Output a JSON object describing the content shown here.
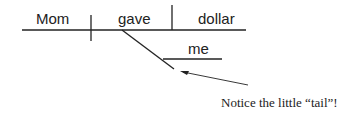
{
  "diagram": {
    "subject": "Mom",
    "verb": "gave",
    "direct_object": "dollar",
    "indirect_object": "me",
    "annotation": "Notice the little “tail”!"
  },
  "colors": {
    "line": "#222222",
    "text": "#222222",
    "background": "#ffffff"
  }
}
